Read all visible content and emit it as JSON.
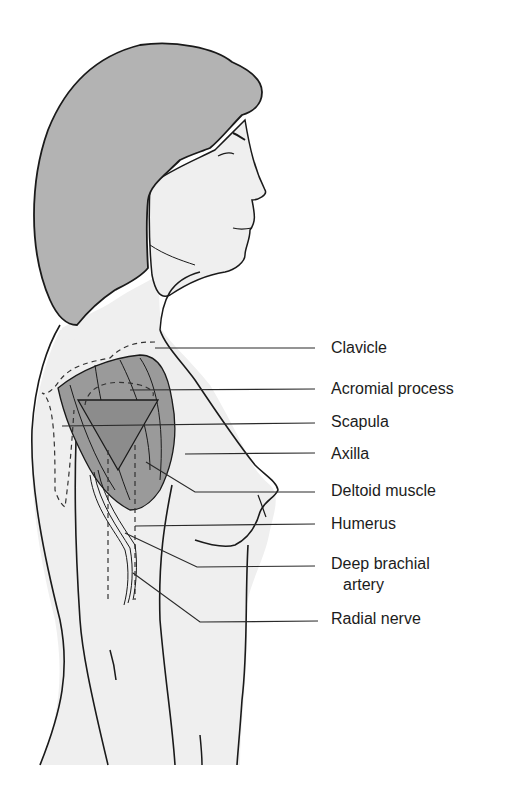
{
  "figure": {
    "colors": {
      "hair": "#b3b3b3",
      "skin": "#efefef",
      "muscle": "#9a9a9a",
      "triangle": "#8c8c8c",
      "outline": "#1a1a1a",
      "leader_line": "#2a2a2a"
    }
  },
  "labels": [
    {
      "id": "clavicle",
      "text": "Clavicle"
    },
    {
      "id": "acromial-process",
      "text": "Acromial process"
    },
    {
      "id": "scapula",
      "text": "Scapula"
    },
    {
      "id": "axilla",
      "text": "Axilla"
    },
    {
      "id": "deltoid-muscle",
      "text": "Deltoid muscle"
    },
    {
      "id": "humerus",
      "text": "Humerus"
    },
    {
      "id": "deep-brachial-artery",
      "text": "Deep brachial",
      "text_line2": "artery"
    },
    {
      "id": "radial-nerve",
      "text": "Radial nerve"
    }
  ]
}
